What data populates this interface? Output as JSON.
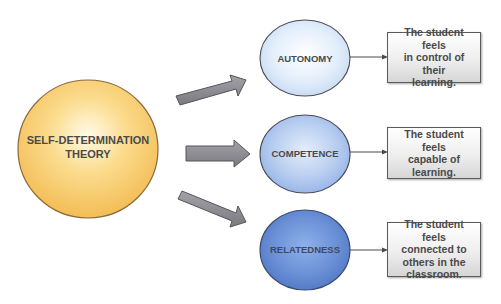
{
  "diagram": {
    "central_node": {
      "label_line1": "SELF-DETERMINATION",
      "label_line2": "THEORY",
      "color": "#f7c766"
    },
    "branches": [
      {
        "label": "AUTONOMY",
        "color": "#cfe0f5",
        "description": "The student feels\nin control of their\nlearning."
      },
      {
        "label": "COMPETENCE",
        "color": "#a9c3ec",
        "description": "The student feels\ncapable of\nlearning."
      },
      {
        "label": "RELATEDNESS",
        "color": "#5f86cf",
        "description": "The student feels\nconnected to\nothers in the\nclassroom."
      }
    ],
    "arrow_color": "#8a8a8e",
    "box_border_color": "#5a5a5a"
  }
}
